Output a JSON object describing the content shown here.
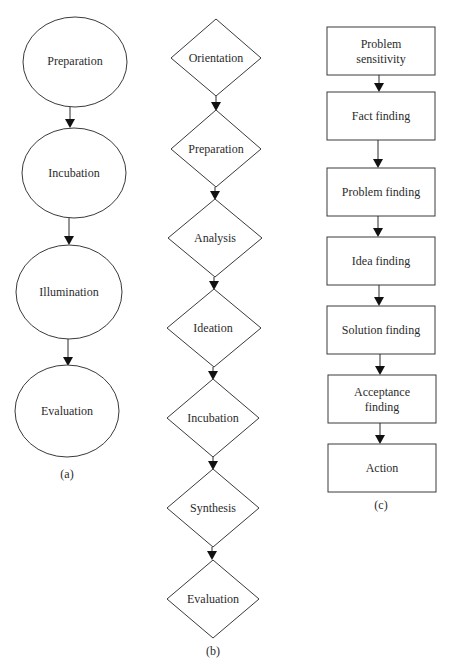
{
  "diagram_a": {
    "caption": "(a)",
    "shape": "ellipse",
    "nodes": [
      {
        "label": "Preparation"
      },
      {
        "label": "Incubation"
      },
      {
        "label": "Illumination"
      },
      {
        "label": "Evaluation"
      }
    ]
  },
  "diagram_b": {
    "caption": "(b)",
    "shape": "diamond",
    "nodes": [
      {
        "label": "Orientation"
      },
      {
        "label": "Preparation"
      },
      {
        "label": "Analysis"
      },
      {
        "label": "Ideation"
      },
      {
        "label": "Incubation"
      },
      {
        "label": "Synthesis"
      },
      {
        "label": "Evaluation"
      }
    ]
  },
  "diagram_c": {
    "caption": "(c)",
    "shape": "rectangle",
    "nodes": [
      {
        "line1": "Problem",
        "line2": "sensitivity"
      },
      {
        "label": "Fact finding"
      },
      {
        "label": "Problem finding"
      },
      {
        "label": "Idea finding"
      },
      {
        "label": "Solution finding"
      },
      {
        "line1": "Acceptance",
        "line2": "finding"
      },
      {
        "label": "Action"
      }
    ]
  },
  "colors": {
    "stroke": "#3a3a3a",
    "text": "#2b2b2b",
    "background": "#ffffff"
  }
}
